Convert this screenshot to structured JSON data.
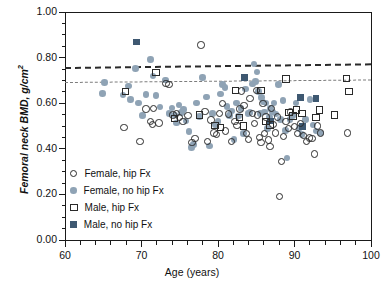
{
  "chart_data": {
    "type": "scatter",
    "title": "",
    "xlabel": "Age (years)",
    "ylabel": "Femoral neck BMD, g/cm2",
    "ylabel_display": "Femoral neck BMD, g/cm",
    "ylabel_superscript": "2",
    "xlim": [
      60,
      100
    ],
    "ylim": [
      0.0,
      1.0
    ],
    "x_ticks": [
      60,
      70,
      80,
      90,
      100
    ],
    "x_tick_labels": [
      "60",
      "70",
      "80",
      "90",
      "100"
    ],
    "x_minor_step": 2,
    "y_ticks": [
      0.0,
      0.2,
      0.4,
      0.6,
      0.8,
      1.0
    ],
    "y_tick_labels": [
      "0.00",
      "0.20",
      "0.40",
      "0.60",
      "0.80",
      "1.00"
    ],
    "y_minor_step": 0.05,
    "grid": false,
    "legend_position": "lower-left",
    "colors": {
      "female_no_fx_fill": "#8fa3b5",
      "male_no_fx_fill": "#3e5871",
      "marker_outline": "#2a2a2a",
      "axis": "#1a1a1a",
      "refline_thick": "#2a2a2a",
      "refline_thin": "#7d7d7d"
    },
    "reference_lines": [
      {
        "name": "thick-dashed-line",
        "y_left": 0.757,
        "y_right": 0.773,
        "style": "dashed-thick",
        "color": "#2a2a2a"
      },
      {
        "name": "thin-dashed-line",
        "y_left": 0.694,
        "y_right": 0.705,
        "style": "dashed-thin",
        "color": "#7d7d7d"
      }
    ],
    "legend": [
      {
        "key": "female_fx",
        "label": "Female, hip Fx",
        "marker": "open-circle"
      },
      {
        "key": "female_no_fx",
        "label": "Female, no hip Fx",
        "marker": "filled-circle"
      },
      {
        "key": "male_fx",
        "label": "Male, hip Fx",
        "marker": "open-square"
      },
      {
        "key": "male_no_fx",
        "label": "Male, no hip Fx",
        "marker": "filled-square"
      }
    ],
    "series": [
      {
        "name": "Female, hip Fx",
        "marker": "open-circle",
        "points": [
          [
            67.7,
            0.493
          ],
          [
            69.8,
            0.432
          ],
          [
            70.6,
            0.575
          ],
          [
            71.2,
            0.52
          ],
          [
            71.4,
            0.506
          ],
          [
            71.6,
            0.578
          ],
          [
            72.3,
            0.513
          ],
          [
            73.2,
            0.686
          ],
          [
            73.6,
            0.681
          ],
          [
            74.1,
            0.549
          ],
          [
            74.6,
            0.556
          ],
          [
            75.0,
            0.536
          ],
          [
            75.4,
            0.52
          ],
          [
            76.1,
            0.547
          ],
          [
            76.6,
            0.427
          ],
          [
            77.0,
            0.446
          ],
          [
            77.8,
            0.855
          ],
          [
            78.3,
            0.563
          ],
          [
            78.6,
            0.432
          ],
          [
            79.1,
            0.527
          ],
          [
            79.5,
            0.47
          ],
          [
            79.8,
            0.463
          ],
          [
            80.2,
            0.556
          ],
          [
            80.6,
            0.6
          ],
          [
            81.0,
            0.478
          ],
          [
            81.4,
            0.553
          ],
          [
            81.8,
            0.432
          ],
          [
            82.2,
            0.519
          ],
          [
            82.5,
            0.503
          ],
          [
            82.9,
            0.574
          ],
          [
            83.1,
            0.654
          ],
          [
            83.4,
            0.59
          ],
          [
            83.7,
            0.466
          ],
          [
            84.0,
            0.44
          ],
          [
            84.2,
            0.621
          ],
          [
            84.5,
            0.556
          ],
          [
            84.8,
            0.51
          ],
          [
            85.0,
            0.656
          ],
          [
            85.2,
            0.548
          ],
          [
            85.4,
            0.45
          ],
          [
            85.6,
            0.428
          ],
          [
            85.9,
            0.598
          ],
          [
            86.1,
            0.466
          ],
          [
            86.3,
            0.54
          ],
          [
            86.6,
            0.438
          ],
          [
            86.8,
            0.41
          ],
          [
            87.0,
            0.578
          ],
          [
            87.2,
            0.506
          ],
          [
            87.5,
            0.47
          ],
          [
            87.8,
            0.54
          ],
          [
            88.0,
            0.19
          ],
          [
            88.3,
            0.345
          ],
          [
            88.6,
            0.455
          ],
          [
            88.9,
            0.52
          ],
          [
            89.2,
            0.489
          ],
          [
            89.5,
            0.561
          ],
          [
            90.0,
            0.497
          ],
          [
            90.4,
            0.466
          ],
          [
            90.8,
            0.51
          ],
          [
            91.2,
            0.458
          ],
          [
            91.6,
            0.433
          ],
          [
            92.0,
            0.447
          ],
          [
            92.3,
            0.445
          ],
          [
            92.6,
            0.377
          ],
          [
            93.0,
            0.5
          ],
          [
            93.4,
            0.47
          ],
          [
            96.9,
            0.47
          ]
        ]
      },
      {
        "name": "Female, no hip Fx",
        "marker": "filled-circle",
        "points": [
          [
            64.9,
            0.643
          ],
          [
            65.2,
            0.692
          ],
          [
            67.6,
            0.636
          ],
          [
            68.3,
            0.676
          ],
          [
            68.6,
            0.615
          ],
          [
            69.2,
            0.753
          ],
          [
            69.6,
            0.601
          ],
          [
            70.1,
            0.545
          ],
          [
            70.6,
            0.637
          ],
          [
            71.2,
            0.792
          ],
          [
            71.5,
            0.72
          ],
          [
            71.9,
            0.633
          ],
          [
            72.4,
            0.583
          ],
          [
            73.1,
            0.702
          ],
          [
            73.6,
            0.556
          ],
          [
            74.0,
            0.579
          ],
          [
            74.3,
            0.548
          ],
          [
            74.6,
            0.514
          ],
          [
            74.9,
            0.592
          ],
          [
            75.2,
            0.559
          ],
          [
            75.5,
            0.573
          ],
          [
            75.8,
            0.522
          ],
          [
            76.2,
            0.476
          ],
          [
            76.5,
            0.406
          ],
          [
            76.8,
            0.419
          ],
          [
            77.2,
            0.6
          ],
          [
            77.6,
            0.541
          ],
          [
            78.0,
            0.712
          ],
          [
            78.5,
            0.628
          ],
          [
            78.9,
            0.412
          ],
          [
            79.3,
            0.555
          ],
          [
            79.7,
            0.505
          ],
          [
            80.0,
            0.52
          ],
          [
            80.3,
            0.64
          ],
          [
            80.6,
            0.682
          ],
          [
            80.9,
            0.67
          ],
          [
            81.2,
            0.586
          ],
          [
            81.5,
            0.547
          ],
          [
            81.8,
            0.566
          ],
          [
            82.1,
            0.441
          ],
          [
            82.4,
            0.6
          ],
          [
            82.7,
            0.543
          ],
          [
            83.0,
            0.576
          ],
          [
            83.3,
            0.468
          ],
          [
            83.6,
            0.663
          ],
          [
            83.9,
            0.555
          ],
          [
            84.2,
            0.559
          ],
          [
            84.5,
            0.685
          ],
          [
            84.7,
            0.772
          ],
          [
            84.9,
            0.694
          ],
          [
            85.1,
            0.736
          ],
          [
            85.3,
            0.652
          ],
          [
            85.5,
            0.556
          ],
          [
            85.7,
            0.625
          ],
          [
            85.9,
            0.605
          ],
          [
            86.1,
            0.562
          ],
          [
            86.3,
            0.6
          ],
          [
            86.5,
            0.488
          ],
          [
            86.7,
            0.54
          ],
          [
            86.9,
            0.576
          ],
          [
            87.1,
            0.562
          ],
          [
            87.3,
            0.6
          ],
          [
            87.6,
            0.552
          ],
          [
            87.9,
            0.682
          ],
          [
            88.2,
            0.528
          ],
          [
            88.5,
            0.613
          ],
          [
            88.8,
            0.48
          ],
          [
            89.0,
            0.36
          ],
          [
            89.4,
            0.528
          ],
          [
            89.8,
            0.545
          ],
          [
            90.2,
            0.6
          ],
          [
            90.6,
            0.49
          ],
          [
            91.0,
            0.463
          ],
          [
            91.4,
            0.528
          ],
          [
            92.0,
            0.615
          ],
          [
            92.4,
            0.505
          ],
          [
            92.8,
            0.478
          ],
          [
            93.4,
            0.47
          ]
        ]
      },
      {
        "name": "Male, hip Fx",
        "marker": "open-square",
        "points": [
          [
            67.9,
            0.652
          ],
          [
            71.9,
            0.735
          ],
          [
            74.3,
            0.533
          ],
          [
            77.6,
            0.549
          ],
          [
            79.6,
            0.502
          ],
          [
            80.3,
            0.493
          ],
          [
            82.3,
            0.656
          ],
          [
            82.8,
            0.538
          ],
          [
            83.3,
            0.5
          ],
          [
            85.6,
            0.656
          ],
          [
            86.3,
            0.52
          ],
          [
            86.8,
            0.505
          ],
          [
            88.9,
            0.706
          ],
          [
            89.3,
            0.56
          ],
          [
            89.8,
            0.543
          ],
          [
            90.3,
            0.57
          ],
          [
            91.0,
            0.556
          ],
          [
            92.8,
            0.536
          ],
          [
            93.3,
            0.57
          ],
          [
            95.2,
            0.549
          ],
          [
            96.8,
            0.708
          ],
          [
            97.1,
            0.652
          ]
        ]
      },
      {
        "name": "Male, no hip Fx",
        "marker": "filled-square",
        "points": [
          [
            69.3,
            0.868
          ],
          [
            83.5,
            0.712
          ],
          [
            86.9,
            0.522
          ],
          [
            90.8,
            0.624
          ],
          [
            91.0,
            0.497
          ],
          [
            92.8,
            0.62
          ]
        ]
      }
    ]
  },
  "axes_geometry": {
    "plot_left_px": 65,
    "plot_right_px": 371,
    "plot_top_px": 12,
    "plot_bottom_px": 240
  }
}
